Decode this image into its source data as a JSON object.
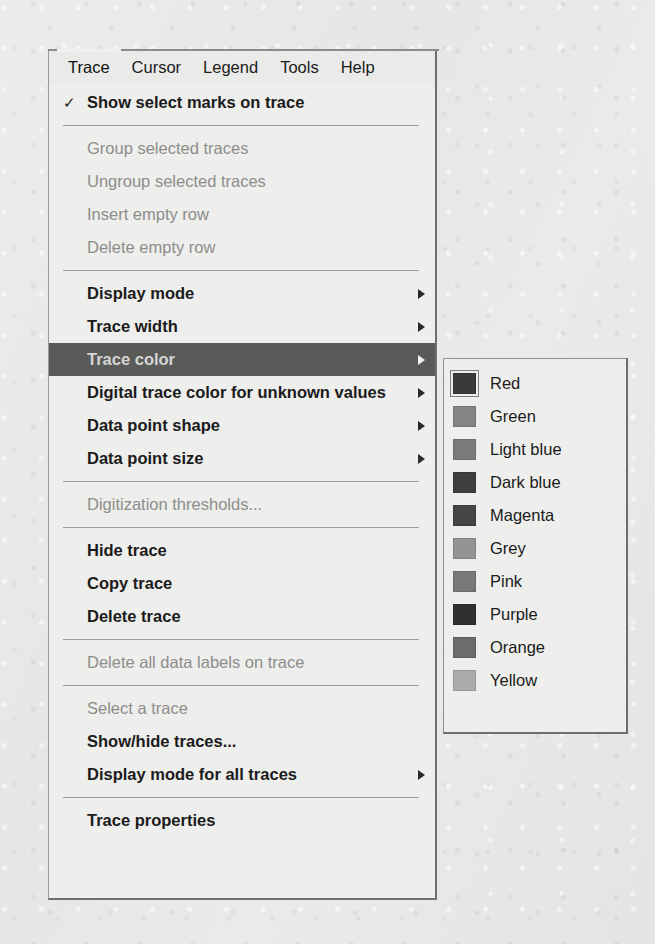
{
  "menubar": {
    "items": [
      {
        "label": "Trace",
        "active": true
      },
      {
        "label": "Cursor",
        "active": false
      },
      {
        "label": "Legend",
        "active": false
      },
      {
        "label": "Tools",
        "active": false
      },
      {
        "label": "Help",
        "active": false
      }
    ]
  },
  "trace_menu": {
    "rows": [
      {
        "kind": "item",
        "label": "Show select marks on trace",
        "checked": true,
        "enabled": true,
        "submenu": false
      },
      {
        "kind": "separator"
      },
      {
        "kind": "item",
        "label": "Group selected traces",
        "checked": false,
        "enabled": false,
        "submenu": false
      },
      {
        "kind": "item",
        "label": "Ungroup selected traces",
        "checked": false,
        "enabled": false,
        "submenu": false
      },
      {
        "kind": "item",
        "label": "Insert empty row",
        "checked": false,
        "enabled": false,
        "submenu": false
      },
      {
        "kind": "item",
        "label": "Delete empty row",
        "checked": false,
        "enabled": false,
        "submenu": false
      },
      {
        "kind": "separator"
      },
      {
        "kind": "item",
        "label": "Display mode",
        "checked": false,
        "enabled": true,
        "submenu": true
      },
      {
        "kind": "item",
        "label": "Trace width",
        "checked": false,
        "enabled": true,
        "submenu": true
      },
      {
        "kind": "item",
        "label": "Trace color",
        "checked": false,
        "enabled": true,
        "submenu": true,
        "highlighted": true
      },
      {
        "kind": "item",
        "label": "Digital trace color for unknown values",
        "checked": false,
        "enabled": true,
        "submenu": true
      },
      {
        "kind": "item",
        "label": "Data point shape",
        "checked": false,
        "enabled": true,
        "submenu": true
      },
      {
        "kind": "item",
        "label": "Data point size",
        "checked": false,
        "enabled": true,
        "submenu": true
      },
      {
        "kind": "separator"
      },
      {
        "kind": "item",
        "label": "Digitization thresholds...",
        "checked": false,
        "enabled": false,
        "submenu": false
      },
      {
        "kind": "separator"
      },
      {
        "kind": "item",
        "label": "Hide trace",
        "checked": false,
        "enabled": true,
        "submenu": false
      },
      {
        "kind": "item",
        "label": "Copy trace",
        "checked": false,
        "enabled": true,
        "submenu": false
      },
      {
        "kind": "item",
        "label": "Delete trace",
        "checked": false,
        "enabled": true,
        "submenu": false
      },
      {
        "kind": "separator"
      },
      {
        "kind": "item",
        "label": "Delete all data labels on trace",
        "checked": false,
        "enabled": false,
        "submenu": false
      },
      {
        "kind": "separator"
      },
      {
        "kind": "item",
        "label": "Select a trace",
        "checked": false,
        "enabled": false,
        "submenu": false
      },
      {
        "kind": "item",
        "label": "Show/hide traces...",
        "checked": false,
        "enabled": true,
        "submenu": false
      },
      {
        "kind": "item",
        "label": "Display mode for all traces",
        "checked": false,
        "enabled": true,
        "submenu": true
      },
      {
        "kind": "separator"
      },
      {
        "kind": "item",
        "label": "Trace properties",
        "checked": false,
        "enabled": true,
        "submenu": false
      }
    ],
    "check_glyph": "✓"
  },
  "color_submenu": {
    "items": [
      {
        "label": "Red",
        "swatch": "#3a3a38",
        "selected": true
      },
      {
        "label": "Green",
        "swatch": "#848482",
        "selected": false
      },
      {
        "label": "Light blue",
        "swatch": "#7b7b79",
        "selected": false
      },
      {
        "label": "Dark blue",
        "swatch": "#3e3e3c",
        "selected": false
      },
      {
        "label": "Magenta",
        "swatch": "#454543",
        "selected": false
      },
      {
        "label": "Grey",
        "swatch": "#949492",
        "selected": false
      },
      {
        "label": "Pink",
        "swatch": "#78787a",
        "selected": false
      },
      {
        "label": "Purple",
        "swatch": "#303030",
        "selected": false
      },
      {
        "label": "Orange",
        "swatch": "#6c6c6a",
        "selected": false
      },
      {
        "label": "Yellow",
        "swatch": "#ababa9",
        "selected": false
      }
    ]
  },
  "theme": {
    "menu_background": "#eeeeec",
    "highlight_background": "#5a5a58",
    "highlight_text": "#d6d6d4",
    "text": "#1b1b1b",
    "disabled_text": "#8d8d8b",
    "separator": "#9d9d9b",
    "page_background": "#e9e9e7"
  }
}
